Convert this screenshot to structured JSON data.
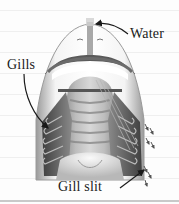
{
  "figure": {
    "labels": {
      "water": "Water",
      "gills": "Gills",
      "gill_slit": "Gill slit"
    },
    "colors": {
      "background": "#fdfdfd",
      "ruled_line": "#efefef",
      "outline": "#8a8a8a",
      "gill_dark": "#4a4a4a",
      "gill_mid": "#7a7a7a",
      "body_light": "#e6e6e6",
      "label_text": "#1a1a1a",
      "arrow": "#1a1a1a"
    },
    "ruled_lines_y": [
      10,
      31,
      52,
      73,
      94,
      115,
      136,
      157,
      178
    ]
  }
}
